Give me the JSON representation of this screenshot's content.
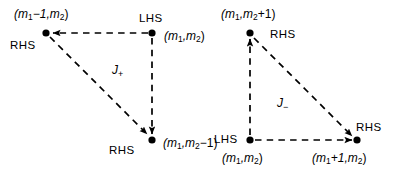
{
  "figure": {
    "background_color": "#ffffff",
    "line_color": "#000000",
    "node_color": "#000000",
    "width": 406,
    "height": 182
  },
  "diagrams": [
    {
      "id": "left",
      "operator_label": "J",
      "operator_subscript": "+",
      "nodes": [
        {
          "id": "left-top-left",
          "coord_label": "(m",
          "coord_sub1": "1",
          "coord_mid": "−1,m",
          "coord_sub2": "2",
          "coord_end": ")",
          "side_label": "RHS"
        },
        {
          "id": "left-top-right",
          "coord_label": "(m",
          "coord_sub1": "1",
          "coord_mid": ",m",
          "coord_sub2": "2",
          "coord_end": ")",
          "side_label": "LHS"
        },
        {
          "id": "left-bottom-right",
          "coord_label": "(m",
          "coord_sub1": "1",
          "coord_mid": ",m",
          "coord_sub2": "2",
          "coord_end": "−1)",
          "side_label": "RHS"
        }
      ]
    },
    {
      "id": "right",
      "operator_label": "J",
      "operator_subscript": "−",
      "nodes": [
        {
          "id": "right-top",
          "coord_label": "(m",
          "coord_sub1": "1",
          "coord_mid": ",m",
          "coord_sub2": "2",
          "coord_end": "+1)",
          "side_label": "RHS"
        },
        {
          "id": "right-bottom-left",
          "coord_label": "(m",
          "coord_sub1": "1",
          "coord_mid": ",m",
          "coord_sub2": "2",
          "coord_end": ")",
          "side_label": "LHS"
        },
        {
          "id": "right-bottom-right",
          "coord_label": "(m",
          "coord_sub1": "1",
          "coord_mid": "+1,m",
          "coord_sub2": "2",
          "coord_end": ")",
          "side_label": "RHS"
        }
      ]
    }
  ]
}
